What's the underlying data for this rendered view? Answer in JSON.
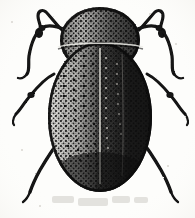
{
  "figure": {
    "kind": "scanned-line-engraving",
    "subject": "beetle",
    "view": "dorsal",
    "alt_text": "Black and white stippled engraving of an oval beetle seen from above, with rounded pronotum, oval elytra, three pairs of legs and clubbed antennae",
    "width": 195,
    "height": 218
  },
  "palette": {
    "background": "#fdfdfb",
    "ink": "#111111",
    "ink_soft": "#2a2a2a",
    "midtone": "#4a4a4a",
    "highlight": "#f6f5f1",
    "scan_smudge": "#cfcdc8",
    "paper_speck": "#d8d6d0"
  },
  "anatomy": {
    "pronotum": {
      "label": "pronotum",
      "center_x": 100,
      "center_y": 40,
      "radius_x": 40,
      "radius_y": 33,
      "tone": "dark-with-stipple-highlight"
    },
    "elytra": {
      "label": "elytra",
      "center_x": 100,
      "center_y": 117,
      "radius_x": 52,
      "radius_y": 75,
      "suture_x": 100,
      "lit_side": "left",
      "shadow_side": "right",
      "puncture_rows": 6,
      "puncture_row_spacing": 11,
      "punctures_per_row": 14
    },
    "division_line": {
      "label": "pronotum-elytra-suture",
      "x1": 58,
      "x2": 143,
      "y": 46
    }
  },
  "appendages": {
    "antennae": [
      {
        "name": "left-antenna",
        "side": "left",
        "path": "M 62 30 C 54 22 50 16 46 12 C 42 9 38 11 38 16 C 38 22 42 26 40 31",
        "club": {
          "x": 39,
          "y": 33,
          "rx": 4,
          "ry": 5
        }
      },
      {
        "name": "right-antenna",
        "side": "right",
        "path": "M 139 30 C 147 22 151 16 155 12 C 159 9 163 11 163 16 C 163 22 159 26 161 31",
        "club": {
          "x": 162,
          "y": 33,
          "rx": 4,
          "ry": 5
        }
      }
    ],
    "legs": [
      {
        "name": "front-leg-left",
        "pair": "front",
        "side": "left",
        "path": "M 66 30 C 56 26 48 24 42 28 C 35 33 31 44 29 56 C 28 64 30 70 27 74",
        "tarsus": "M 27 74 C 24 78 21 79 18 78",
        "width": 3.2
      },
      {
        "name": "front-leg-right",
        "pair": "front",
        "side": "right",
        "path": "M 135 30 C 145 26 153 24 159 28 C 166 33 170 44 172 56 C 173 64 171 70 174 74",
        "tarsus": "M 174 74 C 177 78 180 79 183 78",
        "width": 3.2
      },
      {
        "name": "middle-leg-left",
        "pair": "middle",
        "side": "left",
        "path": "M 54 74 C 46 78 38 86 30 96 C 24 103 20 110 16 114",
        "tarsus": "M 16 114 C 13 118 12 122 14 125",
        "width": 3.0
      },
      {
        "name": "middle-leg-right",
        "pair": "middle",
        "side": "right",
        "path": "M 147 74 C 155 78 163 86 171 96 C 177 103 181 110 185 114",
        "tarsus": "M 185 114 C 188 118 189 122 187 125",
        "width": 3.0
      },
      {
        "name": "hind-leg-left",
        "pair": "hind",
        "side": "left",
        "path": "M 63 136 C 55 146 47 158 40 170 C 35 179 32 186 30 192",
        "tarsus": "M 30 192 C 28 197 26 200 23 202",
        "width": 3.4
      },
      {
        "name": "hind-leg-right",
        "pair": "hind",
        "side": "right",
        "path": "M 138 136 C 146 146 154 158 161 170 C 166 179 169 186 171 192",
        "tarsus": "M 171 192 C 173 197 175 200 178 202",
        "width": 3.4
      }
    ]
  },
  "scan_artifacts": {
    "smudges": [
      {
        "x": 52,
        "y": 196,
        "w": 22,
        "h": 7
      },
      {
        "x": 78,
        "y": 198,
        "w": 30,
        "h": 8
      },
      {
        "x": 112,
        "y": 196,
        "w": 18,
        "h": 7
      },
      {
        "x": 134,
        "y": 197,
        "w": 14,
        "h": 6
      }
    ],
    "specks": [
      {
        "x": 12,
        "y": 22,
        "r": 1
      },
      {
        "x": 176,
        "y": 44,
        "r": 1
      },
      {
        "x": 22,
        "y": 150,
        "r": 1
      },
      {
        "x": 168,
        "y": 166,
        "r": 1
      },
      {
        "x": 40,
        "y": 206,
        "r": 1
      },
      {
        "x": 150,
        "y": 14,
        "r": 1
      }
    ]
  }
}
